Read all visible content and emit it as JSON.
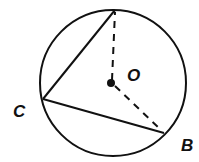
{
  "diagram": {
    "type": "circle-geometry",
    "circle": {
      "center": [
        113,
        83
      ],
      "radius": 73
    },
    "points": {
      "A": {
        "x": 115,
        "y": 10,
        "label": ""
      },
      "B": {
        "x": 164,
        "y": 133,
        "label": "B"
      },
      "C": {
        "x": 43,
        "y": 99,
        "label": "C"
      },
      "O": {
        "x": 111,
        "y": 83,
        "label": "O"
      }
    },
    "segments": [
      {
        "from": "A",
        "to": "C",
        "style": "solid"
      },
      {
        "from": "C",
        "to": "B",
        "style": "solid"
      },
      {
        "from": "O",
        "to": "A",
        "style": "dashed"
      },
      {
        "from": "O",
        "to": "B",
        "style": "dashed"
      }
    ],
    "labels": {
      "C": "C",
      "O": "O",
      "B": "B"
    },
    "colors": {
      "stroke": "#111111",
      "background": "#ffffff"
    }
  }
}
